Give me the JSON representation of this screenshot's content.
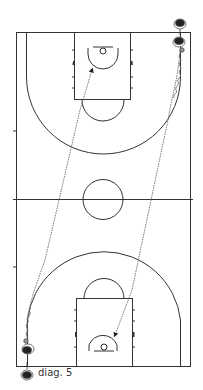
{
  "diagram": {
    "type": "basketball-full-court-drill",
    "caption": "diag. 5",
    "colors": {
      "lines": "#333333",
      "dribble_path": "#888888",
      "player": "#222222",
      "background": "#ffffff"
    },
    "players": [
      {
        "id": "top-right-1",
        "position": "top-right corner outside baseline"
      },
      {
        "id": "top-right-2",
        "position": "top-right corner inside court, dribbling"
      },
      {
        "id": "bottom-left-1",
        "position": "bottom-left corner inside court, dribbling"
      },
      {
        "id": "bottom-left-2",
        "position": "bottom-left corner outside baseline"
      }
    ],
    "paths": [
      {
        "type": "dribble",
        "from": "top-right corner",
        "to": "bottom basket area",
        "arrow": true
      },
      {
        "type": "dribble",
        "from": "bottom-left corner",
        "to": "top basket area",
        "arrow": true
      }
    ]
  }
}
